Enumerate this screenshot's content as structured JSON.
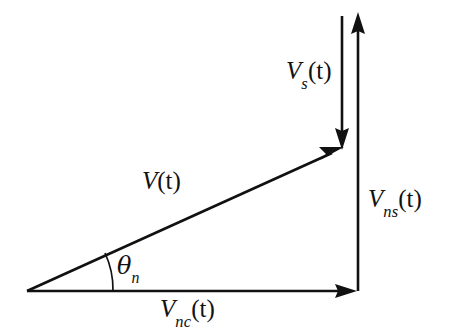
{
  "figure": {
    "type": "vector-diagram",
    "background_color": "#ffffff",
    "stroke_color": "#111111"
  },
  "labels": {
    "resultant": {
      "name": "V(t)",
      "symbol": "V",
      "subscript": "",
      "argument": "(t)"
    },
    "signal": {
      "name": "Vs(t)",
      "symbol": "V",
      "subscript": "s",
      "argument": "(t)"
    },
    "noise_quadrature": {
      "name": "Vns(t)",
      "symbol": "V",
      "subscript": "ns",
      "argument": "(t)"
    },
    "noise_inphase": {
      "name": "Vnc(t)",
      "symbol": "V",
      "subscript": "nc",
      "argument": "(t)"
    },
    "angle": {
      "name": "theta_n",
      "symbol": "θ",
      "subscript": "n"
    }
  },
  "vectors": [
    {
      "id": "vnc",
      "label": "Vnc(t)",
      "from": [
        27,
        291
      ],
      "to": [
        355,
        291
      ],
      "direction": "right",
      "arrowhead": "end"
    },
    {
      "id": "v",
      "label": "V(t)",
      "from": [
        27,
        291
      ],
      "to": [
        343,
        148
      ],
      "direction": "up-right",
      "arrowhead": "end"
    },
    {
      "id": "vs",
      "label": "Vs(t)",
      "from": [
        342,
        16
      ],
      "to": [
        342,
        148
      ],
      "direction": "down",
      "arrowhead": "end"
    },
    {
      "id": "vns",
      "label": "Vns(t)",
      "from": [
        358,
        291
      ],
      "to": [
        358,
        12
      ],
      "direction": "up",
      "arrowhead": "end"
    }
  ],
  "angle_arc": {
    "vertex": [
      27,
      291
    ],
    "radius": 86,
    "from_deg": 0,
    "to_deg": 24.4,
    "label": "theta_n"
  }
}
